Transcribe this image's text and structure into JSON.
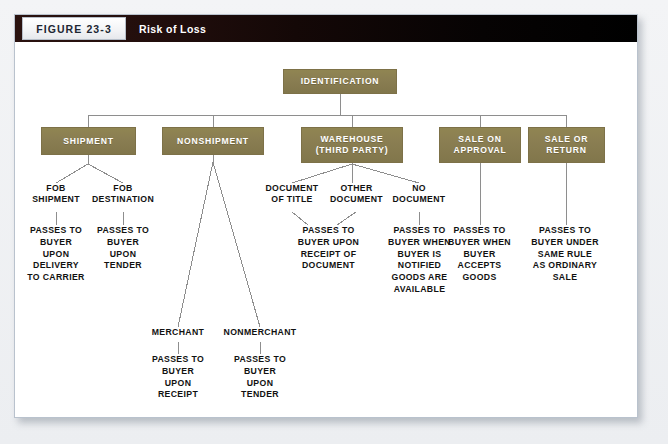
{
  "figure": {
    "tag": "FIGURE 23-3",
    "title": "Risk of Loss",
    "colors": {
      "node_fill": "#8a7f55",
      "header_bar": "#1a0a09",
      "frame_border": "#b9c2cd",
      "text": "#111111"
    }
  },
  "root": {
    "label": "IDENTIFICATION"
  },
  "branches": [
    {
      "node": "SHIPMENT",
      "children": [
        {
          "label": "FOB\nSHIPMENT",
          "outcome": "PASSES TO\nBUYER\nUPON\nDELIVERY\nTO CARRIER"
        },
        {
          "label": "FOB\nDESTINATION",
          "outcome": "PASSES TO\nBUYER\nUPON\nTENDER"
        }
      ]
    },
    {
      "node": "NONSHIPMENT",
      "children": [
        {
          "label": "MERCHANT",
          "outcome": "PASSES TO\nBUYER\nUPON\nRECEIPT"
        },
        {
          "label": "NONMERCHANT",
          "outcome": "PASSES TO\nBUYER\nUPON\nTENDER"
        }
      ]
    },
    {
      "node": "WAREHOUSE\n(THIRD PARTY)",
      "children": [
        {
          "label": "DOCUMENT\nOF TITLE",
          "outcome": "PASSES TO\nBUYER UPON\nRECEIPT OF\nDOCUMENT"
        },
        {
          "label": "OTHER\nDOCUMENT",
          "outcome": "PASSES TO\nBUYER UPON\nRECEIPT OF\nDOCUMENT"
        },
        {
          "label": "NO\nDOCUMENT",
          "outcome": "PASSES TO\nBUYER WHEN\nBUYER IS\nNOTIFIED\nGOODS ARE\nAVAILABLE"
        }
      ]
    },
    {
      "node": "SALE ON\nAPPROVAL",
      "children": [
        {
          "label": "",
          "outcome": "PASSES TO\nBUYER WHEN\nBUYER\nACCEPTS\nGOODS"
        }
      ]
    },
    {
      "node": "SALE OR\nRETURN",
      "children": [
        {
          "label": "",
          "outcome": "PASSES TO\nBUYER UNDER\nSAME RULE\nAS ORDINARY\nSALE"
        }
      ]
    }
  ],
  "nodes": {
    "identification": "IDENTIFICATION",
    "shipment": "SHIPMENT",
    "nonshipment": "NONSHIPMENT",
    "warehouse": "WAREHOUSE\n(THIRD PARTY)",
    "sale_on_approval": "SALE ON\nAPPROVAL",
    "sale_or_return": "SALE OR\nRETURN"
  },
  "labels": {
    "fob_shipment": "FOB\nSHIPMENT",
    "fob_destination": "FOB\nDESTINATION",
    "document_of_title": "DOCUMENT\nOF TITLE",
    "other_document": "OTHER\nDOCUMENT",
    "no_document": "NO\nDOCUMENT",
    "merchant": "MERCHANT",
    "nonmerchant": "NONMERCHANT"
  },
  "outcomes": {
    "fob_shipment": "PASSES TO\nBUYER\nUPON\nDELIVERY\nTO CARRIER",
    "fob_destination": "PASSES TO\nBUYER\nUPON\nTENDER",
    "document": "PASSES TO\nBUYER UPON\nRECEIPT OF\nDOCUMENT",
    "no_document": "PASSES TO\nBUYER WHEN\nBUYER IS\nNOTIFIED\nGOODS ARE\nAVAILABLE",
    "sale_on_approval": "PASSES TO\nBUYER WHEN\nBUYER\nACCEPTS\nGOODS",
    "sale_or_return": "PASSES TO\nBUYER UNDER\nSAME RULE\nAS ORDINARY\nSALE",
    "merchant": "PASSES TO\nBUYER\nUPON\nRECEIPT",
    "nonmerchant": "PASSES TO\nBUYER\nUPON\nTENDER"
  }
}
